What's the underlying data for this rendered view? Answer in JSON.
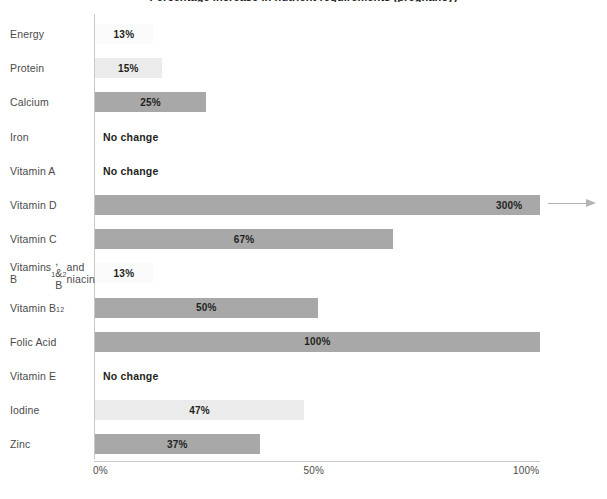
{
  "chart_data": {
    "type": "bar",
    "orientation": "horizontal",
    "title": "Percentage increase in nutrient requirements (pregnancy)",
    "xlabel": "",
    "ylabel": "",
    "xlim": [
      0,
      100
    ],
    "grid": false,
    "legend": "none",
    "xticks": [
      {
        "label": "0%",
        "value": 0
      },
      {
        "label": "50%",
        "value": 50
      },
      {
        "label": "100%",
        "value": 100
      }
    ],
    "categories": [
      "Energy",
      "Protein",
      "Calcium",
      "Iron",
      "Vitamin A",
      "Vitamin D",
      "Vitamin C",
      "Vitamins B1, & B2 and niacin",
      "Vitamin B12",
      "Folic Acid",
      "Vitamin E",
      "Iodine",
      "Zinc"
    ],
    "values": [
      13,
      15,
      25,
      0,
      0,
      300,
      67,
      13,
      50,
      100,
      0,
      47,
      37
    ],
    "value_labels": [
      "13%",
      "15%",
      "25%",
      "No change",
      "No change",
      "300%",
      "67%",
      "13%",
      "50%",
      "100%",
      "No change",
      "47%",
      "37%"
    ],
    "annotations": [
      "Vitamin D bar exceeds the 100% axis and is truncated with an arrow; actual value 300%"
    ]
  },
  "colors": {
    "bar_light": "#ebebeb",
    "bar_dark": "#a8a8a8",
    "bar_faint": "#fbfbfb",
    "axis": "#c9c9c9",
    "text": "#231f20",
    "label_text": "#4a4a4a",
    "background": "#ffffff"
  },
  "rows": [
    {
      "label": "Energy",
      "label_html": "Energy",
      "value": 13,
      "value_label": "13%",
      "shade": "faint",
      "no_change": false,
      "multiline": false
    },
    {
      "label": "Protein",
      "label_html": "Protein",
      "value": 15,
      "value_label": "15%",
      "shade": "light",
      "no_change": false,
      "multiline": false
    },
    {
      "label": "Calcium",
      "label_html": "Calcium",
      "value": 25,
      "value_label": "25%",
      "shade": "dark",
      "no_change": false,
      "multiline": false
    },
    {
      "label": "Iron",
      "label_html": "Iron",
      "value": 0,
      "value_label": "No change",
      "shade": "none",
      "no_change": true,
      "multiline": false
    },
    {
      "label": "Vitamin A",
      "label_html": "Vitamin A",
      "value": 0,
      "value_label": "No change",
      "shade": "none",
      "no_change": true,
      "multiline": false
    },
    {
      "label": "Vitamin D",
      "label_html": "Vitamin D",
      "value": 300,
      "value_label": "300%",
      "shade": "dark",
      "no_change": false,
      "multiline": false,
      "overflow": true
    },
    {
      "label": "Vitamin C",
      "label_html": "Vitamin C",
      "value": 67,
      "value_label": "67%",
      "shade": "dark",
      "no_change": false,
      "multiline": false
    },
    {
      "label": "Vitamins B1, & B2 and niacin",
      "label_html": "Vitamins B<sub>1</sub>,<br>&amp; B<sub>2</sub> and<br>niacin",
      "value": 13,
      "value_label": "13%",
      "shade": "faint",
      "no_change": false,
      "multiline": true
    },
    {
      "label": "Vitamin B12",
      "label_html": "Vitamin B<sub>12</sub>",
      "value": 50,
      "value_label": "50%",
      "shade": "dark",
      "no_change": false,
      "multiline": false
    },
    {
      "label": "Folic Acid",
      "label_html": "Folic Acid",
      "value": 100,
      "value_label": "100%",
      "shade": "dark",
      "no_change": false,
      "multiline": false
    },
    {
      "label": "Vitamin E",
      "label_html": "Vitamin E",
      "value": 0,
      "value_label": "No change",
      "shade": "none",
      "no_change": true,
      "multiline": false
    },
    {
      "label": "Iodine",
      "label_html": "Iodine",
      "value": 47,
      "value_label": "47%",
      "shade": "light",
      "no_change": false,
      "multiline": false
    },
    {
      "label": "Zinc",
      "label_html": "Zinc",
      "value": 37,
      "value_label": "37%",
      "shade": "dark",
      "no_change": false,
      "multiline": false
    }
  ],
  "axis": {
    "ticks": [
      "0%",
      "50%",
      "100%"
    ]
  }
}
